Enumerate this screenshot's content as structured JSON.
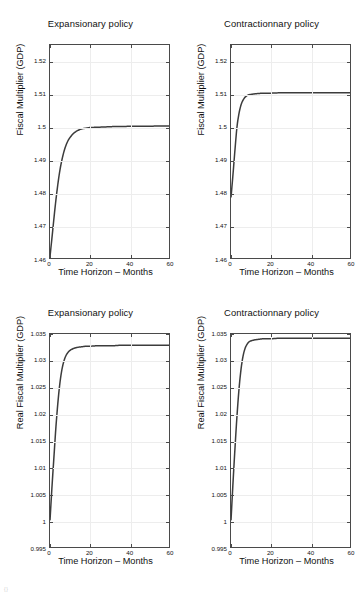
{
  "figure": {
    "width": 362,
    "height": 594,
    "background": "#ffffff",
    "line_color": "#3c3c3c",
    "axis_color": "#4a4a4a",
    "grid_color": "#ededed",
    "corner_mark": "{}"
  },
  "chart_data": [
    {
      "type": "line",
      "panel": "top-left",
      "title": "Expansionary policy",
      "xlabel": "Time Horizon – Months",
      "ylabel": "Fiscal Multiplier (GDP)",
      "xlim": [
        0,
        60
      ],
      "ylim": [
        1.46,
        1.525
      ],
      "xticks": [
        0,
        20,
        40,
        60
      ],
      "xticklabels": [
        "0",
        "20",
        "40",
        "60"
      ],
      "yticks": [
        1.46,
        1.47,
        1.48,
        1.49,
        1.5,
        1.51,
        1.52
      ],
      "yticklabels": [
        "1.46",
        "1.47",
        "1.48",
        "1.49",
        "1.5",
        "1.51",
        "1.52"
      ],
      "grid": true,
      "legend": "none",
      "series": [
        {
          "name": "Fiscal multiplier – expansionary",
          "x": [
            0,
            1,
            2,
            3,
            4,
            5,
            6,
            7,
            8,
            9,
            10,
            12,
            14,
            16,
            18,
            20,
            24,
            28,
            32,
            36,
            40,
            45,
            50,
            55,
            60
          ],
          "y": [
            1.4605,
            1.4662,
            1.4722,
            1.4778,
            1.4827,
            1.4868,
            1.4899,
            1.4924,
            1.4943,
            1.4957,
            1.4967,
            1.4981,
            1.4989,
            1.4994,
            1.4996,
            1.4998,
            1.4999,
            1.5,
            1.5001,
            1.5001,
            1.5002,
            1.5002,
            1.5002,
            1.5003,
            1.5003
          ]
        }
      ]
    },
    {
      "type": "line",
      "panel": "top-right",
      "title": "Contractionnary policy",
      "xlabel": "Time Horizon – Months",
      "ylabel": "Fiscal Multiplier (GDP)",
      "xlim": [
        0,
        60
      ],
      "ylim": [
        1.46,
        1.525
      ],
      "xticks": [
        0,
        20,
        40,
        60
      ],
      "xticklabels": [
        "0",
        "20",
        "40",
        "60"
      ],
      "yticks": [
        1.46,
        1.47,
        1.48,
        1.49,
        1.5,
        1.51,
        1.52
      ],
      "yticklabels": [
        "1.46",
        "1.47",
        "1.48",
        "1.49",
        "1.5",
        "1.51",
        "1.52"
      ],
      "grid": true,
      "legend": "none",
      "series": [
        {
          "name": "Fiscal multiplier – contractionary",
          "x": [
            0,
            1,
            2,
            3,
            4,
            5,
            6,
            7,
            8,
            9,
            10,
            12,
            14,
            16,
            18,
            20,
            24,
            28,
            32,
            36,
            40,
            45,
            50,
            55,
            60
          ],
          "y": [
            1.4785,
            1.4855,
            1.493,
            1.4999,
            1.504,
            1.5066,
            1.5081,
            1.509,
            1.5095,
            1.5098,
            1.5099,
            1.5101,
            1.5102,
            1.5103,
            1.5103,
            1.5103,
            1.5104,
            1.5104,
            1.5104,
            1.5104,
            1.5104,
            1.5104,
            1.5104,
            1.5104,
            1.5104
          ]
        }
      ]
    },
    {
      "type": "line",
      "panel": "bottom-left",
      "title": "Expansionary policy",
      "xlabel": "Time Horizon – Months",
      "ylabel": "Real Fiscal Multiplier (GDP)",
      "xlim": [
        0,
        60
      ],
      "ylim": [
        0.995,
        1.035
      ],
      "xticks": [
        0,
        20,
        40,
        60
      ],
      "xticklabels": [
        "0",
        "20",
        "40",
        "60"
      ],
      "yticks": [
        0.995,
        1.0,
        1.005,
        1.01,
        1.015,
        1.02,
        1.025,
        1.03,
        1.035
      ],
      "yticklabels": [
        "0.995",
        "1",
        "1.005",
        "1.01",
        "1.015",
        "1.02",
        "1.025",
        "1.03",
        "1.035"
      ],
      "grid": true,
      "legend": "none",
      "series": [
        {
          "name": "Real fiscal multiplier – expansionary",
          "x": [
            0,
            1,
            2,
            3,
            4,
            5,
            6,
            7,
            8,
            9,
            10,
            12,
            14,
            16,
            18,
            20,
            24,
            28,
            32,
            36,
            40,
            45,
            50,
            55,
            60
          ],
          "y": [
            1.0,
            1.0063,
            1.012,
            1.0176,
            1.0222,
            1.0258,
            1.0283,
            1.0299,
            1.0309,
            1.0315,
            1.0319,
            1.0323,
            1.0325,
            1.0326,
            1.0327,
            1.0327,
            1.0328,
            1.0328,
            1.0328,
            1.0329,
            1.0329,
            1.0329,
            1.0329,
            1.0329,
            1.0329
          ]
        }
      ]
    },
    {
      "type": "line",
      "panel": "bottom-right",
      "title": "Contractionnary policy",
      "xlabel": "Time Horizon – Months",
      "ylabel": "Real Fiscal Multiplier (GDP)",
      "xlim": [
        0,
        60
      ],
      "ylim": [
        0.995,
        1.035
      ],
      "xticks": [
        0,
        20,
        40,
        60
      ],
      "xticklabels": [
        "0",
        "20",
        "40",
        "60"
      ],
      "yticks": [
        0.995,
        1.0,
        1.005,
        1.01,
        1.015,
        1.02,
        1.025,
        1.03,
        1.035
      ],
      "yticklabels": [
        "0.995",
        "1",
        "1.005",
        "1.01",
        "1.015",
        "1.02",
        "1.025",
        "1.03",
        "1.035"
      ],
      "grid": true,
      "legend": "none",
      "series": [
        {
          "name": "Real fiscal multiplier – contractionary",
          "x": [
            0,
            1,
            2,
            3,
            4,
            5,
            6,
            7,
            8,
            9,
            10,
            12,
            14,
            16,
            18,
            20,
            24,
            28,
            32,
            36,
            40,
            45,
            50,
            55,
            60
          ],
          "y": [
            1.0,
            1.007,
            1.0135,
            1.0195,
            1.0245,
            1.0282,
            1.0307,
            1.0322,
            1.033,
            1.0335,
            1.0337,
            1.0339,
            1.034,
            1.0341,
            1.0341,
            1.0341,
            1.0342,
            1.0342,
            1.0342,
            1.0342,
            1.0342,
            1.0342,
            1.0342,
            1.0342,
            1.0342
          ]
        }
      ]
    }
  ]
}
